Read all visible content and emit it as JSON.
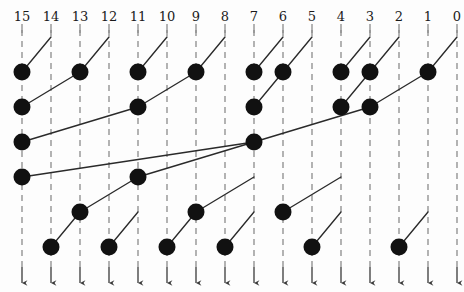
{
  "diagram": {
    "kind": "parallel-prefix-network",
    "title_visible": false,
    "width": 464,
    "height": 292,
    "colors": {
      "node": "#111111",
      "edge": "#2a2a2a",
      "wire": "#8c8c8c",
      "label": "#1a1a1a",
      "background": "#fdfdfd"
    },
    "geometry": {
      "column_x_start": 22,
      "column_spacing": 29,
      "row_y_start": 72,
      "row_spacing": 35,
      "node_radius": 8.5,
      "wire_top": 30,
      "wire_bottom": 285,
      "label_y": 10
    },
    "columns": [
      {
        "index": 0,
        "label": "15",
        "x": 22
      },
      {
        "index": 1,
        "label": "14",
        "x": 51
      },
      {
        "index": 2,
        "label": "13",
        "x": 80
      },
      {
        "index": 3,
        "label": "12",
        "x": 109
      },
      {
        "index": 4,
        "label": "11",
        "x": 138
      },
      {
        "index": 5,
        "label": "10",
        "x": 167
      },
      {
        "index": 6,
        "label": "9",
        "x": 196
      },
      {
        "index": 7,
        "label": "8",
        "x": 225
      },
      {
        "index": 8,
        "label": "7",
        "x": 254
      },
      {
        "index": 9,
        "label": "6",
        "x": 283
      },
      {
        "index": 10,
        "label": "5",
        "x": 312
      },
      {
        "index": 11,
        "label": "4",
        "x": 341
      },
      {
        "index": 12,
        "label": "3",
        "x": 370
      },
      {
        "index": 13,
        "label": "2",
        "x": 399
      },
      {
        "index": 14,
        "label": "1",
        "x": 428
      },
      {
        "index": 15,
        "label": "0",
        "x": 457
      }
    ],
    "rows": [
      {
        "index": 0,
        "y": 72
      },
      {
        "index": 1,
        "y": 107
      },
      {
        "index": 2,
        "y": 142
      },
      {
        "index": 3,
        "y": 177
      },
      {
        "index": 4,
        "y": 212
      },
      {
        "index": 5,
        "y": 247
      }
    ],
    "nodes": [
      {
        "col": 0,
        "row": 0
      },
      {
        "col": 0,
        "row": 1
      },
      {
        "col": 0,
        "row": 2
      },
      {
        "col": 0,
        "row": 3
      },
      {
        "col": 1,
        "row": 5
      },
      {
        "col": 2,
        "row": 0
      },
      {
        "col": 2,
        "row": 4
      },
      {
        "col": 3,
        "row": 5
      },
      {
        "col": 4,
        "row": 0
      },
      {
        "col": 4,
        "row": 1
      },
      {
        "col": 4,
        "row": 3
      },
      {
        "col": 5,
        "row": 5
      },
      {
        "col": 6,
        "row": 0
      },
      {
        "col": 6,
        "row": 4
      },
      {
        "col": 7,
        "row": 5
      },
      {
        "col": 8,
        "row": 0
      },
      {
        "col": 8,
        "row": 1
      },
      {
        "col": 8,
        "row": 2
      },
      {
        "col": 9,
        "row": 0
      },
      {
        "col": 9,
        "row": 4
      },
      {
        "col": 10,
        "row": 5
      },
      {
        "col": 11,
        "row": 0
      },
      {
        "col": 11,
        "row": 1
      },
      {
        "col": 12,
        "row": 0
      },
      {
        "col": 12,
        "row": 1
      },
      {
        "col": 13,
        "row": 5
      },
      {
        "col": 14,
        "row": 0
      }
    ],
    "edges": [
      {
        "from_col": 0,
        "from_row": 0,
        "to_col": 1,
        "to_row": -1
      },
      {
        "from_col": 0,
        "from_row": 1,
        "to_col": 2,
        "to_row": 0
      },
      {
        "from_col": 0,
        "from_row": 2,
        "to_col": 4,
        "to_row": 1
      },
      {
        "from_col": 0,
        "from_row": 3,
        "to_col": 8,
        "to_row": 2
      },
      {
        "from_col": 1,
        "from_row": 5,
        "to_col": 2,
        "to_row": 4
      },
      {
        "from_col": 2,
        "from_row": 0,
        "to_col": 3,
        "to_row": -1
      },
      {
        "from_col": 2,
        "from_row": 4,
        "to_col": 4,
        "to_row": 3
      },
      {
        "from_col": 3,
        "from_row": 5,
        "to_col": 4,
        "to_row": 4
      },
      {
        "from_col": 4,
        "from_row": 0,
        "to_col": 5,
        "to_row": -1
      },
      {
        "from_col": 4,
        "from_row": 1,
        "to_col": 6,
        "to_row": 0
      },
      {
        "from_col": 4,
        "from_row": 3,
        "to_col": 8,
        "to_row": 2
      },
      {
        "from_col": 5,
        "from_row": 5,
        "to_col": 6,
        "to_row": 4
      },
      {
        "from_col": 6,
        "from_row": 0,
        "to_col": 7,
        "to_row": -1
      },
      {
        "from_col": 6,
        "from_row": 4,
        "to_col": 8,
        "to_row": 3
      },
      {
        "from_col": 7,
        "from_row": 5,
        "to_col": 8,
        "to_row": 4
      },
      {
        "from_col": 8,
        "from_row": 0,
        "to_col": 9,
        "to_row": -1
      },
      {
        "from_col": 8,
        "from_row": 1,
        "to_col": 9,
        "to_row": 0
      },
      {
        "from_col": 8,
        "from_row": 2,
        "to_col": 12,
        "to_row": 1
      },
      {
        "from_col": 9,
        "from_row": 0,
        "to_col": 10,
        "to_row": -1
      },
      {
        "from_col": 9,
        "from_row": 4,
        "to_col": 11,
        "to_row": 3
      },
      {
        "from_col": 10,
        "from_row": 5,
        "to_col": 11,
        "to_row": 4
      },
      {
        "from_col": 11,
        "from_row": 0,
        "to_col": 12,
        "to_row": -1
      },
      {
        "from_col": 11,
        "from_row": 1,
        "to_col": 12,
        "to_row": 0
      },
      {
        "from_col": 12,
        "from_row": 0,
        "to_col": 13,
        "to_row": -1
      },
      {
        "from_col": 12,
        "from_row": 1,
        "to_col": 14,
        "to_row": 0
      },
      {
        "from_col": 13,
        "from_row": 5,
        "to_col": 14,
        "to_row": 4
      },
      {
        "from_col": 14,
        "from_row": 0,
        "to_col": 15,
        "to_row": -1
      }
    ]
  }
}
